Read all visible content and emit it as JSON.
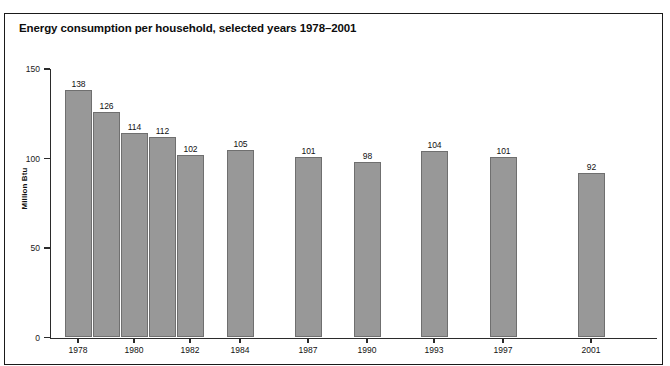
{
  "figure": {
    "header": "FIGURE 3.3",
    "title": "Energy consumption per household, selected years 1978–2001"
  },
  "chart_data": {
    "type": "bar",
    "title": "Energy consumption per household, selected years 1978–2001",
    "xlabel": "",
    "ylabel": "Million Btu",
    "ylim": [
      0,
      150
    ],
    "yticks": [
      "0",
      "50",
      "100",
      "150"
    ],
    "ytick_values": [
      0,
      50,
      100,
      150
    ],
    "grid": false,
    "legend": "none",
    "bar_color": "#989898",
    "bar_edge_color": "#6f6f6f",
    "categories": [
      "1978",
      "1979",
      "1980",
      "1981",
      "1982",
      "1984",
      "1987",
      "1990",
      "1993",
      "1997",
      "2001"
    ],
    "tick_labels": [
      "1978",
      "1980",
      "1982",
      "1984",
      "1987",
      "1990",
      "1993",
      "1997",
      "2001"
    ],
    "values": [
      138,
      126,
      114,
      112,
      102,
      105,
      101,
      98,
      104,
      101,
      92
    ],
    "data_labels": [
      "138",
      "126",
      "114",
      "112",
      "102",
      "105",
      "101",
      "98",
      "104",
      "101",
      "92"
    ]
  }
}
